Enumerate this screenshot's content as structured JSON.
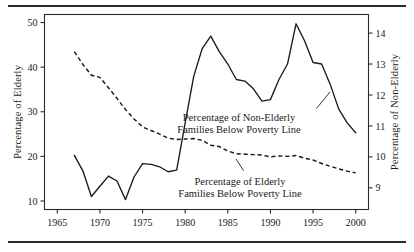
{
  "figure": {
    "background_color": "#ffffff",
    "ink_color": "#1a1a1a",
    "rule_top_label": "top-rule",
    "rule_bottom_label": "bottom-rule"
  },
  "chart_data": {
    "type": "line",
    "title": "",
    "subtitle": "",
    "xlabel": "",
    "ylabel": "Percentage of Elderly",
    "y2label": "Percentage of Non-Elderly",
    "xlim": [
      1963.5,
      2001.5
    ],
    "ylim": [
      8.1,
      51.8
    ],
    "y2lim": [
      8.3,
      14.6
    ],
    "grid": false,
    "legend_position": "inline-annotations",
    "xticks": [
      1965,
      1970,
      1975,
      1980,
      1985,
      1990,
      1995,
      2000
    ],
    "xticklabels": [
      "1965",
      "1970",
      "1975",
      "1980",
      "1985",
      "1990",
      "1995",
      "2000"
    ],
    "yticks": [
      10,
      20,
      30,
      40,
      50
    ],
    "yticklabels": [
      "10",
      "20",
      "30",
      "40",
      "50"
    ],
    "y2ticks": [
      9,
      10,
      11,
      12,
      13,
      14
    ],
    "y2ticklabels": [
      "9",
      "10",
      "11",
      "12",
      "13",
      "14"
    ],
    "x": [
      1967,
      1968,
      1969,
      1970,
      1971,
      1972,
      1973,
      1974,
      1975,
      1976,
      1977,
      1978,
      1979,
      1980,
      1981,
      1982,
      1983,
      1984,
      1985,
      1986,
      1987,
      1988,
      1989,
      1990,
      1991,
      1992,
      1993,
      1994,
      1995,
      1996,
      1997,
      1998,
      1999,
      2000
    ],
    "series": [
      {
        "name": "Percentage of Elderly Families Below Poverty Line",
        "axis": "left",
        "style": "dashed",
        "values": [
          43.5,
          40.6,
          38.2,
          37.7,
          35.4,
          33.0,
          30.5,
          28.4,
          26.6,
          25.8,
          25.0,
          24.1,
          23.8,
          23.9,
          24.0,
          23.6,
          22.5,
          22.2,
          21.2,
          20.6,
          20.5,
          20.4,
          20.3,
          19.9,
          20.1,
          20.0,
          20.2,
          19.6,
          19.2,
          18.4,
          17.8,
          17.2,
          16.7,
          16.3
        ]
      },
      {
        "name": "Percentage of Non-Elderly Families Below Poverty Line",
        "axis": "right",
        "style": "solid",
        "values": [
          10.05,
          9.55,
          8.72,
          9.05,
          9.38,
          9.22,
          8.62,
          9.35,
          9.78,
          9.76,
          9.68,
          9.52,
          9.57,
          11.1,
          12.6,
          13.5,
          13.9,
          13.4,
          13.0,
          12.5,
          12.45,
          12.2,
          11.8,
          11.85,
          12.5,
          13.0,
          14.3,
          13.75,
          13.05,
          13.0,
          12.35,
          11.55,
          11.1,
          10.78
        ]
      }
    ],
    "annotations": [
      {
        "id": "annotation-non-elderly",
        "line1": "Percentage of Non-Elderly",
        "line2": "Families Below Poverty Line",
        "target_series": "Percentage of Non-Elderly Families Below Poverty Line"
      },
      {
        "id": "annotation-elderly",
        "line1": "Percentage of Elderly",
        "line2": "Families Below Poverty Line",
        "target_series": "Percentage of Elderly Families Below Poverty Line"
      }
    ]
  }
}
